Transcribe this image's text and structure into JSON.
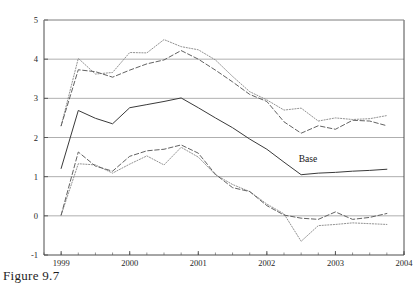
{
  "figure": {
    "caption": "Figure 9.7"
  },
  "chart_data": {
    "type": "line",
    "title": "",
    "xlabel": "",
    "ylabel": "",
    "xlim": [
      1998.75,
      2004.0
    ],
    "ylim": [
      -1,
      5
    ],
    "grid": true,
    "legend_position": "inline-annotation",
    "x_tick_labels": [
      "1999",
      "2000",
      "2001",
      "2002",
      "2003",
      "2004"
    ],
    "x_ticks": [
      1999,
      2000,
      2001,
      2002,
      2003,
      2004
    ],
    "x_minor_tick_step": 0.25,
    "y_tick_labels": [
      "5",
      "4",
      "3",
      "2",
      "1",
      "0",
      "-1"
    ],
    "y_ticks": [
      5,
      4,
      3,
      2,
      1,
      0,
      -1
    ],
    "annotations": [
      {
        "text": "Base",
        "x": 2002.6,
        "y": 1.38
      }
    ],
    "x": [
      1999.0,
      1999.25,
      1999.5,
      1999.75,
      2000.0,
      2000.25,
      2000.5,
      2000.75,
      2001.0,
      2001.25,
      2001.5,
      2001.75,
      2002.0,
      2002.25,
      2002.5,
      2002.75,
      2003.0,
      2003.25,
      2003.5,
      2003.75
    ],
    "series": [
      {
        "name": "upper-dotted",
        "style": "dotted",
        "values": [
          2.3,
          4.02,
          3.62,
          3.66,
          4.17,
          4.16,
          4.5,
          4.32,
          4.24,
          3.98,
          3.56,
          3.17,
          2.96,
          2.7,
          2.75,
          2.42,
          2.5,
          2.46,
          2.48,
          2.56
        ]
      },
      {
        "name": "upper-dashed",
        "style": "dashed",
        "values": [
          2.3,
          3.73,
          3.68,
          3.54,
          3.72,
          3.88,
          3.98,
          4.22,
          4.0,
          3.72,
          3.42,
          3.1,
          2.92,
          2.4,
          2.11,
          2.3,
          2.21,
          2.44,
          2.42,
          2.3
        ]
      },
      {
        "name": "base-solid",
        "style": "solid",
        "values": [
          1.21,
          2.69,
          2.49,
          2.35,
          2.76,
          2.84,
          2.92,
          3.01,
          2.76,
          2.5,
          2.25,
          1.96,
          1.7,
          1.37,
          1.05,
          1.09,
          1.11,
          1.14,
          1.16,
          1.19
        ]
      },
      {
        "name": "lower-dotted",
        "style": "dotted",
        "values": [
          0.02,
          1.33,
          1.3,
          1.09,
          1.32,
          1.53,
          1.3,
          1.75,
          1.5,
          1.05,
          0.8,
          0.62,
          0.3,
          0.05,
          -0.65,
          -0.25,
          -0.22,
          -0.18,
          -0.2,
          -0.22
        ]
      },
      {
        "name": "lower-dashed",
        "style": "dashed",
        "values": [
          0.02,
          1.63,
          1.27,
          1.14,
          1.52,
          1.66,
          1.7,
          1.81,
          1.6,
          1.06,
          0.72,
          0.62,
          0.26,
          0.02,
          -0.06,
          -0.09,
          0.1,
          -0.09,
          -0.04,
          0.06
        ]
      }
    ]
  },
  "colors": {
    "axis": "#4d4d4d",
    "grid": "#9a9a9a",
    "upper_dotted": "#8c8c8c",
    "upper_dashed": "#5a5a5a",
    "base_solid": "#3a3a3a",
    "lower_dotted": "#8c8c8c",
    "lower_dashed": "#5a5a5a",
    "text": "#1a1a1a"
  }
}
